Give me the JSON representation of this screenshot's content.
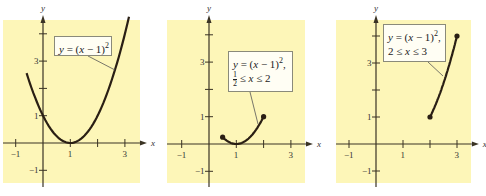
{
  "chart_data": [
    {
      "type": "line",
      "title": "y = (x - 1)^2",
      "function": "y = (x - 1)^2",
      "domain": [
        -0.6,
        3.15
      ],
      "endpoints": [],
      "xlabel": "x",
      "ylabel": "y",
      "xticks": [
        -1,
        1,
        2,
        3
      ],
      "xtick_labels": [
        "-1",
        "1",
        "3"
      ],
      "yticks": [
        -1,
        1,
        2,
        3,
        4
      ],
      "ytick_labels": [
        "-1",
        "1",
        "3"
      ],
      "xlim": [
        -1.5,
        3.5
      ],
      "ylim": [
        -1.5,
        4.5
      ],
      "grid": false,
      "annotation": {
        "line1": "y = (x − 1)",
        "sup": "2",
        "line2": ""
      }
    },
    {
      "type": "line",
      "title": "y = (x - 1)^2, 1/2 <= x <= 2",
      "function": "y = (x - 1)^2",
      "domain": [
        0.5,
        2
      ],
      "endpoints": [
        [
          0.5,
          0.25
        ],
        [
          2,
          1
        ]
      ],
      "xlabel": "x",
      "ylabel": "y",
      "xticks": [
        -1,
        1,
        2,
        3
      ],
      "xtick_labels": [
        "-1",
        "1",
        "3"
      ],
      "yticks": [
        -1,
        1,
        2,
        3,
        4
      ],
      "ytick_labels": [
        "-1",
        "1",
        "3"
      ],
      "xlim": [
        -1.5,
        3.5
      ],
      "ylim": [
        -1.5,
        4.5
      ],
      "grid": false,
      "annotation": {
        "line1": "y = (x − 1)",
        "sup": "2",
        "line2": "≤ x ≤ 2",
        "frac_num": "1",
        "frac_den": "2"
      }
    },
    {
      "type": "line",
      "title": "y = (x - 1)^2, 2 <= x <= 3",
      "function": "y = (x - 1)^2",
      "domain": [
        2,
        3
      ],
      "endpoints": [
        [
          2,
          1
        ],
        [
          3,
          4
        ]
      ],
      "xlabel": "x",
      "ylabel": "y",
      "xticks": [
        -1,
        1,
        2,
        3
      ],
      "xtick_labels": [
        "-1",
        "1",
        "3"
      ],
      "yticks": [
        -1,
        1,
        2,
        3,
        4
      ],
      "ytick_labels": [
        "-1",
        "1",
        "3"
      ],
      "xlim": [
        -1.5,
        3.5
      ],
      "ylim": [
        -1.5,
        4.5
      ],
      "grid": false,
      "annotation": {
        "line1": "y = (x − 1)",
        "sup": "2",
        "line2": "2 ≤ x ≤ 3"
      }
    }
  ],
  "colors": {
    "panel_bg": "#fdf6b8",
    "curve": "#2a1f14",
    "axis": "#3a3324"
  }
}
